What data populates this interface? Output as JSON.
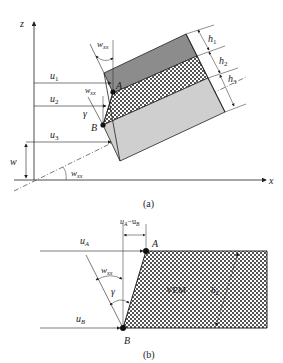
{
  "figure_a": {
    "caption": "(a)",
    "axis_z": "z",
    "axis_x": "x",
    "labels": {
      "u1": "u",
      "u1_sub": "1",
      "u2": "u",
      "u2_sub": "2",
      "u3": "u",
      "u3_sub": "3",
      "w": "w",
      "wxx_top": "w",
      "wxx_top_sub": "xx",
      "wxx_mid": "w",
      "wxx_mid_sub": "xx",
      "wxx_bottom": "w",
      "wxx_bottom_sub": "xx",
      "gamma": "γ",
      "A": "A",
      "B": "B",
      "h1": "h",
      "h1_sub": "1",
      "h2": "h",
      "h2_sub": "2",
      "h3": "h",
      "h3_sub": "3"
    },
    "layers": [
      {
        "name": "top-layer",
        "fill": "#8c8c8c"
      },
      {
        "name": "core-layer",
        "fill": "crosshatch"
      },
      {
        "name": "bottom-layer",
        "fill": "#cfcfcf"
      }
    ]
  },
  "figure_b": {
    "caption": "(b)",
    "labels": {
      "uA": "u",
      "uA_sub": "A",
      "uB": "u",
      "uB_sub": "B",
      "diff": "u",
      "diff_sub1": "A",
      "diff_mid": "−u",
      "diff_sub2": "B",
      "wxx": "w",
      "wxx_sub": "xx",
      "gamma": "γ",
      "A": "A",
      "B": "B",
      "vem": "VEM",
      "h": "h",
      "h_sub": "2"
    }
  }
}
